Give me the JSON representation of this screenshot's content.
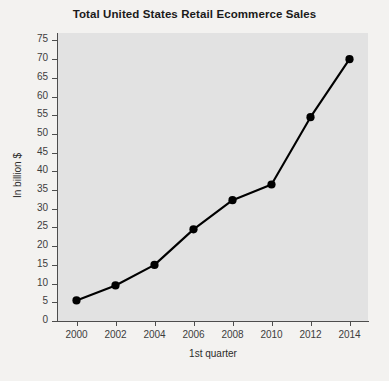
{
  "chart_data": {
    "type": "line",
    "title": "Total United States Retail Ecommerce Sales",
    "xlabel": "1st quarter",
    "ylabel": "In billion $",
    "categories": [
      "2000",
      "2002",
      "2004",
      "2006",
      "2008",
      "2010",
      "2012",
      "2014"
    ],
    "x": [
      2000,
      2002,
      2004,
      2006,
      2008,
      2010,
      2012,
      2014
    ],
    "values": [
      5.5,
      9.5,
      15.0,
      24.5,
      32.3,
      36.5,
      54.5,
      70.0
    ],
    "series": [
      {
        "name": "Total United States Retail Ecommerce Sales",
        "values": [
          5.5,
          9.5,
          15.0,
          24.5,
          32.3,
          36.5,
          54.5,
          70.0
        ]
      }
    ],
    "xlim": [
      1999,
      2015
    ],
    "ylim": [
      0,
      77
    ],
    "ytick_labels": [
      "0",
      "5",
      "10",
      "15",
      "20",
      "25",
      "30",
      "35",
      "40",
      "45",
      "50",
      "55",
      "60",
      "65",
      "70",
      "75"
    ],
    "ytick_values": [
      0,
      5,
      10,
      15,
      20,
      25,
      30,
      35,
      40,
      45,
      50,
      55,
      60,
      65,
      70,
      75
    ],
    "xtick_labels": [
      "2000",
      "2002",
      "2004",
      "2006",
      "2008",
      "2010",
      "2012",
      "2014"
    ],
    "grid": false,
    "legend": "none",
    "line_color": "#000000",
    "marker": "circle",
    "marker_color": "#000000",
    "plot_background": "#e2e2e2",
    "page_background": "#f3f2f0",
    "axis_color": "#4d4d4d",
    "title_color": "#1a1a1a"
  }
}
